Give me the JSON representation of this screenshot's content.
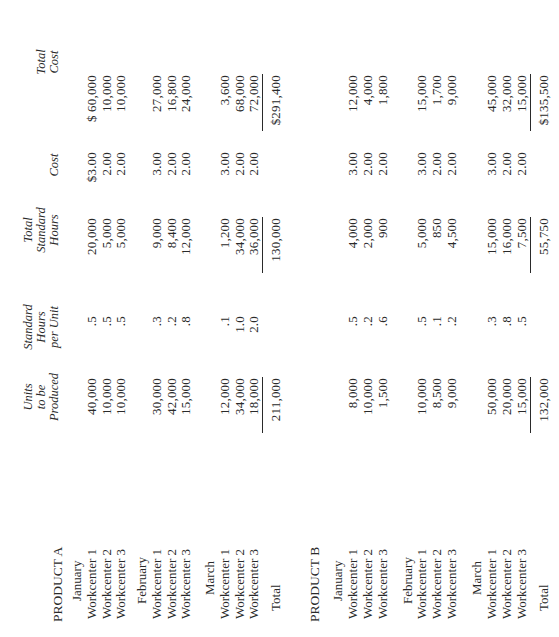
{
  "headers": {
    "units": [
      "Units",
      "to be",
      "Produced"
    ],
    "std_hours_per_unit": [
      "Standard",
      "Hours",
      "per Unit"
    ],
    "total_std_hours": [
      "Total",
      "Standard",
      "Hours"
    ],
    "cost": [
      "Cost"
    ],
    "total_cost": [
      "Total",
      "Cost"
    ]
  },
  "products": [
    {
      "name": "PRODUCT A",
      "months": [
        {
          "name": "January",
          "rows": [
            {
              "label": "Workcenter 1",
              "units": "40,000",
              "shpu": ".5",
              "tsh": "20,000",
              "cost": "$3.00",
              "total_cost": "$ 60,000"
            },
            {
              "label": "Workcenter 2",
              "units": "10,000",
              "shpu": ".5",
              "tsh": "5,000",
              "cost": "2.00",
              "total_cost": "10,000"
            },
            {
              "label": "Workcenter 3",
              "units": "10,000",
              "shpu": ".5",
              "tsh": "5,000",
              "cost": "2.00",
              "total_cost": "10,000"
            }
          ]
        },
        {
          "name": "February",
          "rows": [
            {
              "label": "Workcenter 1",
              "units": "30,000",
              "shpu": ".3",
              "tsh": "9,000",
              "cost": "3.00",
              "total_cost": "27,000"
            },
            {
              "label": "Workcenter 2",
              "units": "42,000",
              "shpu": ".2",
              "tsh": "8,400",
              "cost": "2.00",
              "total_cost": "16,800"
            },
            {
              "label": "Workcenter 3",
              "units": "15,000",
              "shpu": ".8",
              "tsh": "12,000",
              "cost": "2.00",
              "total_cost": "24,000"
            }
          ]
        },
        {
          "name": "March",
          "rows": [
            {
              "label": "Workcenter 1",
              "units": "12,000",
              "shpu": ".1",
              "tsh": "1,200",
              "cost": "3.00",
              "total_cost": "3,600"
            },
            {
              "label": "Workcenter 2",
              "units": "34,000",
              "shpu": "1.0",
              "tsh": "34,000",
              "cost": "2.00",
              "total_cost": "68,000"
            },
            {
              "label": "Workcenter 3",
              "units": "18,000",
              "shpu": "2.0",
              "tsh": "36,000",
              "cost": "2.00",
              "total_cost": "72,000"
            }
          ]
        }
      ],
      "total": {
        "label": "Total",
        "units": "211,000",
        "tsh": "130,000",
        "total_cost": "$291,400"
      }
    },
    {
      "name": "PRODUCT B",
      "months": [
        {
          "name": "January",
          "rows": [
            {
              "label": "Workcenter 1",
              "units": "8,000",
              "shpu": ".5",
              "tsh": "4,000",
              "cost": "3.00",
              "total_cost": "12,000"
            },
            {
              "label": "Workcenter 2",
              "units": "10,000",
              "shpu": ".2",
              "tsh": "2,000",
              "cost": "2.00",
              "total_cost": "4,000"
            },
            {
              "label": "Workcenter 3",
              "units": "1,500",
              "shpu": ".6",
              "tsh": "900",
              "cost": "2.00",
              "total_cost": "1,800"
            }
          ]
        },
        {
          "name": "February",
          "rows": [
            {
              "label": "Workcenter 1",
              "units": "10,000",
              "shpu": ".5",
              "tsh": "5,000",
              "cost": "3.00",
              "total_cost": "15,000"
            },
            {
              "label": "Workcenter 2",
              "units": "8,500",
              "shpu": ".1",
              "tsh": "850",
              "cost": "2.00",
              "total_cost": "1,700"
            },
            {
              "label": "Workcenter 3",
              "units": "9,000",
              "shpu": ".2",
              "tsh": "4,500",
              "cost": "2.00",
              "total_cost": "9,000"
            }
          ]
        },
        {
          "name": "March",
          "rows": [
            {
              "label": "Workcenter 1",
              "units": "50,000",
              "shpu": ".3",
              "tsh": "15,000",
              "cost": "3.00",
              "total_cost": "45,000"
            },
            {
              "label": "Workcenter 2",
              "units": "20,000",
              "shpu": ".8",
              "tsh": "16,000",
              "cost": "2.00",
              "total_cost": "32,000"
            },
            {
              "label": "Workcenter 3",
              "units": "15,000",
              "shpu": ".5",
              "tsh": "7,500",
              "cost": "2.00",
              "total_cost": "15,000"
            }
          ]
        }
      ],
      "total": {
        "label": "Total",
        "units": "132,000",
        "tsh": "55,750",
        "total_cost": "$135,500"
      }
    }
  ]
}
